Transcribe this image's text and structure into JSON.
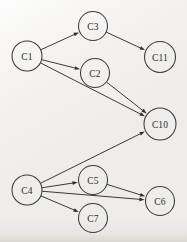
{
  "diagram": {
    "background_color": "#efedea",
    "stroke_color": "#3a3a3a",
    "label_color": "#2b2b2b",
    "width": 187,
    "height": 242,
    "nodes": [
      {
        "id": "C1",
        "label": "C1",
        "cx": 27,
        "cy": 56,
        "r": 15
      },
      {
        "id": "C3",
        "label": "C3",
        "cx": 93,
        "cy": 26,
        "r": 14.5
      },
      {
        "id": "C11",
        "label": "C11",
        "cx": 160,
        "cy": 57,
        "r": 15.5
      },
      {
        "id": "C2",
        "label": "C2",
        "cx": 95,
        "cy": 73,
        "r": 14.5
      },
      {
        "id": "C10",
        "label": "C10",
        "cx": 160,
        "cy": 124,
        "r": 16
      },
      {
        "id": "C4",
        "label": "C4",
        "cx": 27,
        "cy": 190,
        "r": 15
      },
      {
        "id": "C5",
        "label": "C5",
        "cx": 93,
        "cy": 180,
        "r": 14.5
      },
      {
        "id": "C7",
        "label": "C7",
        "cx": 93,
        "cy": 218,
        "r": 14.5
      },
      {
        "id": "C6",
        "label": "C6",
        "cx": 160,
        "cy": 201,
        "r": 14.5
      }
    ],
    "edges": [
      {
        "from": "C1",
        "to": "C3"
      },
      {
        "from": "C1",
        "to": "C2"
      },
      {
        "from": "C1",
        "to": "C10"
      },
      {
        "from": "C3",
        "to": "C11"
      },
      {
        "from": "C2",
        "to": "C10"
      },
      {
        "from": "C4",
        "to": "C10"
      },
      {
        "from": "C4",
        "to": "C5"
      },
      {
        "from": "C4",
        "to": "C6"
      },
      {
        "from": "C4",
        "to": "C7"
      },
      {
        "from": "C5",
        "to": "C6"
      }
    ]
  }
}
